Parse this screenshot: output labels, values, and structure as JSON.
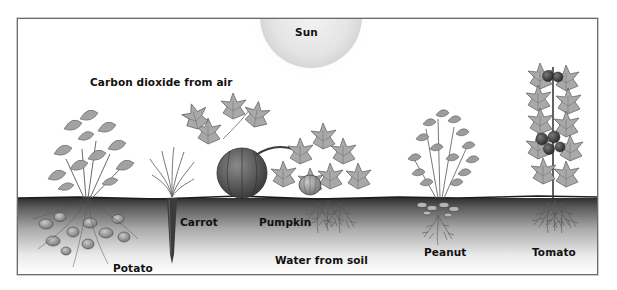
{
  "diagram": {
    "type": "plant-growth-illustration",
    "sun_label": "Sun",
    "air_label": "Carbon dioxide from air",
    "water_label": "Water from soil",
    "plants": [
      {
        "id": "potato",
        "label": "Potato"
      },
      {
        "id": "carrot",
        "label": "Carrot"
      },
      {
        "id": "pumpkin",
        "label": "Pumpkin"
      },
      {
        "id": "peanut",
        "label": "Peanut"
      },
      {
        "id": "tomato",
        "label": "Tomato"
      }
    ]
  },
  "colors": {
    "frame": "#6b6b6b",
    "soil_dark": "#2e2e2e",
    "soil_light": "#ffffff",
    "sun": "#e6e6e6",
    "leaf": "#9a9a9a",
    "leaf_dark": "#6e6e6e",
    "fruit": "#5a5a5a"
  }
}
